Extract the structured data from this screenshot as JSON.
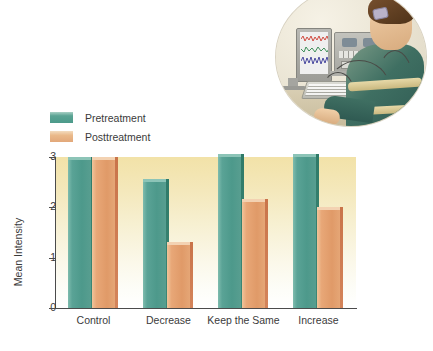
{
  "figure": {
    "illustration_alt": "biofeedback-session-illustration"
  },
  "legend": {
    "items": [
      {
        "label": "Pretreatment",
        "key": "pre",
        "color": "#4c9a8a"
      },
      {
        "label": "Posttreatment",
        "key": "post",
        "color": "#e2a87a"
      }
    ]
  },
  "chart_data": {
    "type": "bar",
    "title": "",
    "xlabel": "",
    "ylabel": "Mean Intensity",
    "categories": [
      "Control",
      "Decrease",
      "Keep the Same",
      "Increase"
    ],
    "series": [
      {
        "name": "Pretreatment",
        "color": "#4c9a8a",
        "values": [
          2.95,
          2.5,
          3.0,
          3.0
        ]
      },
      {
        "name": "Posttreatment",
        "color": "#e2a87a",
        "values": [
          2.95,
          1.25,
          2.1,
          1.95
        ]
      }
    ],
    "ylim": [
      0,
      3
    ],
    "yticks": [
      0,
      1,
      2,
      3
    ],
    "ytick_labels": [
      "0",
      "1",
      "2",
      "3"
    ],
    "grid": false,
    "legend_position": "above-left"
  }
}
